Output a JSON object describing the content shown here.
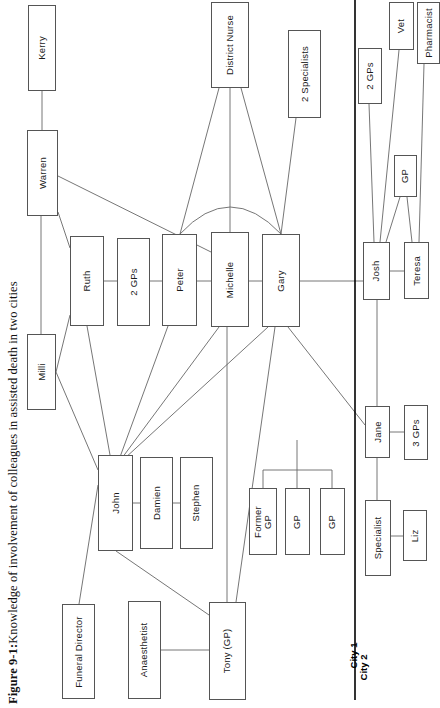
{
  "figure": {
    "caption_prefix": "Figure 9-1:",
    "caption_text": " Knowledge of involvement of colleagues in assisted death in two cities"
  },
  "divider": {
    "city_left_label": "City 1",
    "city_right_label": "City 2",
    "color": "#000000"
  },
  "style": {
    "node_border": "#555555",
    "node_fill": "#ffffff",
    "edge_color": "#666666"
  },
  "nodes": [
    {
      "id": "kerry",
      "label": "Kerry",
      "x": 28,
      "y": 5,
      "w": 28,
      "h": 86
    },
    {
      "id": "warren",
      "label": "Warren",
      "x": 27,
      "y": 130,
      "w": 31,
      "h": 86
    },
    {
      "id": "milli",
      "label": "Milli",
      "x": 27,
      "y": 334,
      "w": 29,
      "h": 76
    },
    {
      "id": "ruth",
      "label": "Ruth",
      "x": 70,
      "y": 236,
      "w": 34,
      "h": 90
    },
    {
      "id": "two_gps_c1",
      "label": "2 GPs",
      "x": 117,
      "y": 238,
      "w": 33,
      "h": 88
    },
    {
      "id": "peter",
      "label": "Peter",
      "x": 162,
      "y": 234,
      "w": 35,
      "h": 92
    },
    {
      "id": "michelle",
      "label": "Michelle",
      "x": 211,
      "y": 232,
      "w": 38,
      "h": 95
    },
    {
      "id": "gary",
      "label": "Gary",
      "x": 262,
      "y": 234,
      "w": 38,
      "h": 93
    },
    {
      "id": "district_nurse",
      "label": "District Nurse",
      "x": 211,
      "y": 2,
      "w": 38,
      "h": 86
    },
    {
      "id": "two_specialists",
      "label": "2 Specialists",
      "x": 288,
      "y": 30,
      "w": 33,
      "h": 88
    },
    {
      "id": "john",
      "label": "John",
      "x": 98,
      "y": 455,
      "w": 35,
      "h": 96
    },
    {
      "id": "damien",
      "label": "Damien",
      "x": 140,
      "y": 457,
      "w": 33,
      "h": 92
    },
    {
      "id": "stephen",
      "label": "Stephen",
      "x": 180,
      "y": 457,
      "w": 33,
      "h": 92
    },
    {
      "id": "funeral_director",
      "label": "Funeral Director",
      "x": 62,
      "y": 604,
      "w": 33,
      "h": 95
    },
    {
      "id": "anaesthetist",
      "label": "Anaesthetist",
      "x": 128,
      "y": 601,
      "w": 33,
      "h": 98
    },
    {
      "id": "tony_gp",
      "label": "Tony (GP)",
      "x": 209,
      "y": 602,
      "w": 37,
      "h": 98
    },
    {
      "id": "former_gp",
      "label": "Former\nGP",
      "x": 249,
      "y": 488,
      "w": 28,
      "h": 67
    },
    {
      "id": "gp_mid1",
      "label": "GP",
      "x": 285,
      "y": 488,
      "w": 25,
      "h": 67
    },
    {
      "id": "gp_mid2",
      "label": "GP",
      "x": 320,
      "y": 488,
      "w": 25,
      "h": 67
    },
    {
      "id": "two_gps_c2",
      "label": "2 GPs",
      "x": 358,
      "y": 48,
      "w": 24,
      "h": 56
    },
    {
      "id": "vet",
      "label": "Vet",
      "x": 389,
      "y": 2,
      "w": 25,
      "h": 48
    },
    {
      "id": "pharmacist",
      "label": "Pharmacist",
      "x": 417,
      "y": 2,
      "w": 23,
      "h": 62
    },
    {
      "id": "gp_c2",
      "label": "GP",
      "x": 394,
      "y": 155,
      "w": 23,
      "h": 42
    },
    {
      "id": "josh",
      "label": "Josh",
      "x": 363,
      "y": 242,
      "w": 27,
      "h": 58
    },
    {
      "id": "teresa",
      "label": "Teresa",
      "x": 404,
      "y": 242,
      "w": 25,
      "h": 57
    },
    {
      "id": "jane",
      "label": "Jane",
      "x": 365,
      "y": 406,
      "w": 25,
      "h": 52
    },
    {
      "id": "three_gps",
      "label": "3 GPs",
      "x": 404,
      "y": 405,
      "w": 24,
      "h": 55
    },
    {
      "id": "specialist",
      "label": "Specialist",
      "x": 365,
      "y": 500,
      "w": 26,
      "h": 76
    },
    {
      "id": "liz",
      "label": "Liz",
      "x": 403,
      "y": 510,
      "w": 24,
      "h": 51
    }
  ],
  "edges": [
    {
      "from": "kerry",
      "to": "warren",
      "path": "M 42,91 L 42,130"
    },
    {
      "from": "warren",
      "to": "milli",
      "path": "M 41,216 L 41,334"
    },
    {
      "from": "warren",
      "to": "ruth",
      "path": "M 58,212 L 70,248"
    },
    {
      "from": "warren",
      "to": "michelle",
      "path": "M 58,176 L 211,252"
    },
    {
      "from": "ruth",
      "to": "milli",
      "path": "M 70,315 L 56,372"
    },
    {
      "from": "milli",
      "to": "john",
      "path": "M 56,372 L 98,470"
    },
    {
      "from": "ruth",
      "to": "john",
      "path": "M 87,326 L 110,455"
    },
    {
      "from": "ruth",
      "to": "two_gps_c1",
      "path": "M 104,281 L 117,281"
    },
    {
      "from": "two_gps_c1",
      "to": "peter",
      "path": "M 150,281 L 162,281"
    },
    {
      "from": "peter",
      "to": "michelle",
      "path": "M 197,281 L 211,281"
    },
    {
      "from": "michelle",
      "to": "gary",
      "path": "M 249,281 L 262,281"
    },
    {
      "from": "district_nurse",
      "to": "peter",
      "path": "M 219,88 L 180,234"
    },
    {
      "from": "district_nurse",
      "to": "michelle",
      "path": "M 230,88 L 230,232"
    },
    {
      "from": "district_nurse",
      "to": "gary",
      "path": "M 241,88 L 281,234"
    },
    {
      "from": "peter",
      "to": "gary",
      "path": "M 180,234 Q 230,180 281,234"
    },
    {
      "from": "two_specialists",
      "to": "gary",
      "path": "M 296,118 L 281,234"
    },
    {
      "from": "gary",
      "to": "josh",
      "path": "M 300,281 L 363,281"
    },
    {
      "from": "peter",
      "to": "john",
      "path": "M 168,326 L 120,457"
    },
    {
      "from": "michelle",
      "to": "john",
      "path": "M 219,327 L 122,458"
    },
    {
      "from": "gary",
      "to": "john",
      "path": "M 268,327 L 124,459"
    },
    {
      "from": "gary",
      "to": "tony_gp",
      "path": "M 275,327 L 236,602"
    },
    {
      "from": "gary",
      "to": "jane",
      "path": "M 288,327 L 365,425"
    },
    {
      "from": "john",
      "to": "damien",
      "path": "M 133,503 L 140,503"
    },
    {
      "from": "damien",
      "to": "stephen",
      "path": "M 173,503 L 180,503"
    },
    {
      "from": "john",
      "to": "funeral_director",
      "path": "M 98,485 L 79,604"
    },
    {
      "from": "john",
      "to": "tony_gp",
      "path": "M 116,551 L 209,615"
    },
    {
      "from": "anaesthetist",
      "to": "tony_gp",
      "path": "M 161,650 L 209,650"
    },
    {
      "from": "tony_gp",
      "to": "gp_bracket",
      "path": "M 227,602 L 227,300"
    },
    {
      "from": "bracket",
      "to": "gp_group",
      "path": "M 263,488 L 263,470 L 332,470 L 332,488"
    },
    {
      "from": "bracket_stem",
      "to": "gp_group",
      "path": "M 297,470 L 297,488"
    },
    {
      "from": "bracket_stem2",
      "to": "gp_group",
      "path": "M 297,470 L 297,440"
    },
    {
      "from": "two_gps_c2",
      "to": "josh",
      "path": "M 369,104 L 374,242"
    },
    {
      "from": "vet",
      "to": "josh",
      "path": "M 399,50 L 380,242"
    },
    {
      "from": "gp_c2",
      "to": "josh",
      "path": "M 400,197 L 386,242"
    },
    {
      "from": "gp_c2",
      "to": "teresa",
      "path": "M 407,197 L 412,242"
    },
    {
      "from": "pharmacist",
      "to": "teresa",
      "path": "M 424,64 L 419,242"
    },
    {
      "from": "josh",
      "to": "teresa",
      "path": "M 390,271 L 404,271"
    },
    {
      "from": "josh",
      "to": "jane",
      "path": "M 377,300 L 377,406"
    },
    {
      "from": "jane",
      "to": "three_gps",
      "path": "M 390,432 L 404,432"
    },
    {
      "from": "jane",
      "to": "specialist",
      "path": "M 377,458 L 377,500"
    },
    {
      "from": "specialist",
      "to": "liz",
      "path": "M 391,536 L 403,536"
    }
  ]
}
